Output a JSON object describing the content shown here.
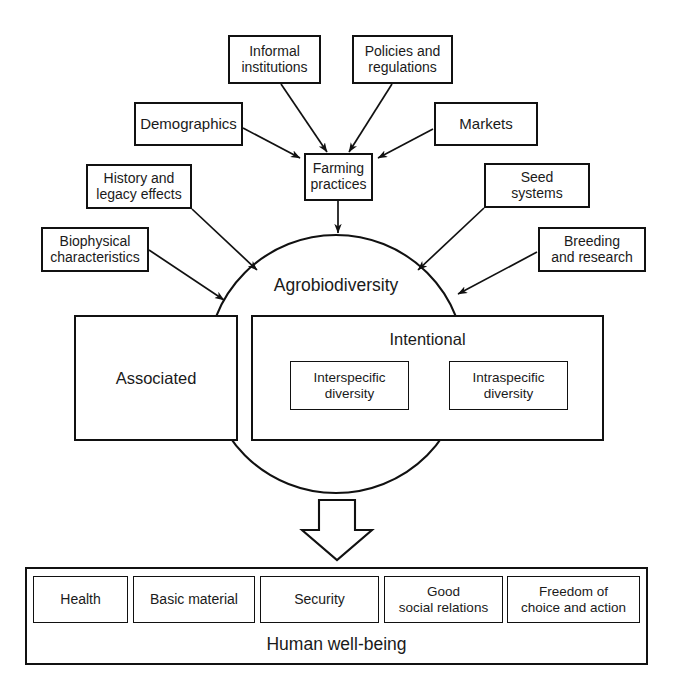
{
  "diagram": {
    "center": {
      "label": "Agrobiodiversity",
      "compartments": [
        {
          "key": "associated",
          "label": "Associated"
        },
        {
          "key": "intentional",
          "label": "Intentional",
          "children": [
            {
              "key": "interspecific",
              "label": "Interspecific\ndiversity"
            },
            {
              "key": "intraspecific",
              "label": "Intraspecific\ndiversity"
            }
          ]
        }
      ]
    },
    "hub": {
      "label": "Farming\npractices"
    },
    "drivers_to_hub": [
      {
        "key": "informal-institutions",
        "label": "Informal\ninstitutions"
      },
      {
        "key": "policies-and-regulations",
        "label": "Policies and\nregulations"
      },
      {
        "key": "demographics",
        "label": "Demographics"
      },
      {
        "key": "markets",
        "label": "Markets"
      }
    ],
    "drivers_to_center": [
      {
        "key": "history-and-legacy-effects",
        "label": "History and\nlegacy effects"
      },
      {
        "key": "biophysical-characteristics",
        "label": "Biophysical\ncharacteristics"
      },
      {
        "key": "seed-systems",
        "label": "Seed\nsystems"
      },
      {
        "key": "breeding-and-research",
        "label": "Breeding\nand research"
      }
    ],
    "outcome": {
      "title": "Human well-being",
      "components": [
        {
          "key": "health",
          "label": "Health"
        },
        {
          "key": "basic-material",
          "label": "Basic material"
        },
        {
          "key": "security",
          "label": "Security"
        },
        {
          "key": "good-social-relations",
          "label": "Good\nsocial relations"
        },
        {
          "key": "freedom-of-choice-and-action",
          "label": "Freedom of\nchoice and action"
        }
      ]
    },
    "colors": {
      "stroke": "#111111",
      "text": "#1a1a1a",
      "background": "#ffffff"
    }
  }
}
